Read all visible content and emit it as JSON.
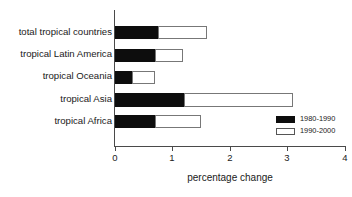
{
  "chart_data": {
    "type": "bar",
    "orientation": "horizontal",
    "stacked": true,
    "title": "",
    "xlabel": "percentage change",
    "ylabel": "",
    "xlim": [
      0,
      4
    ],
    "xticks": [
      0,
      1,
      2,
      3,
      4
    ],
    "xtick_labels": [
      "0",
      "1",
      "2",
      "3",
      "4"
    ],
    "grid": false,
    "legend_position": "lower-right",
    "categories": [
      "total tropical countries",
      "tropical Latin America",
      "tropical Oceania",
      "tropical Asia",
      "tropical Africa"
    ],
    "series": [
      {
        "name": "1980-1990",
        "color": "#0d0d0d",
        "values": [
          0.75,
          0.7,
          0.3,
          1.2,
          0.7
        ]
      },
      {
        "name": "1990-2000",
        "color": "#ffffff",
        "values": [
          0.85,
          0.48,
          0.4,
          1.9,
          0.8
        ]
      }
    ],
    "totals": [
      1.6,
      1.18,
      0.7,
      3.1,
      1.5
    ]
  },
  "axis": {
    "x_title": "percentage change"
  },
  "legend": {
    "items": [
      {
        "label": "1980-1990"
      },
      {
        "label": "1990-2000"
      }
    ]
  }
}
